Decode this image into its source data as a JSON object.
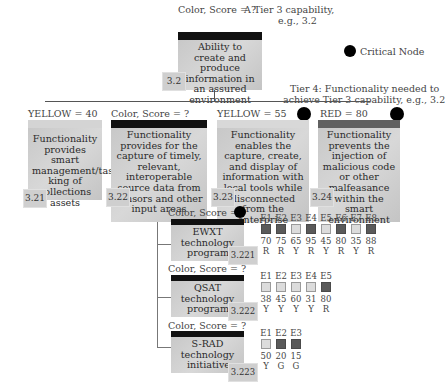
{
  "tier3": {
    "status": "Color, Score = ?",
    "annotation": "A Tier 3 capability, e.g., 3.2",
    "annotation_line1": "A Tier 3 capability,",
    "annotation_line2": "e.g., 3.2",
    "box_text": "Ability to create and produce information in an assured environment",
    "id": "3.2",
    "bar_color": "#111111"
  },
  "legend": {
    "critical_node_label": "Critical Node"
  },
  "tier4_annotation": {
    "line1": "Tier 4: Functionality needed to",
    "line2": "achieve Tier 3 capability, e.g., 3.2"
  },
  "tier4": [
    {
      "id": "3.21",
      "status": "YELLOW = 40",
      "bar_color": "#d4d4d4",
      "critical": false,
      "text": "Functionality provides smart management/tas king of collections assets"
    },
    {
      "id": "3.22",
      "status": "Color, Score = ?",
      "bar_color": "#111111",
      "critical": false,
      "text": "Functionality provides for the capture of timely, relevant, interoperable source data from sensors and other input areas"
    },
    {
      "id": "3.23",
      "status": "YELLOW = 55",
      "bar_color": "#d8d8d8",
      "critical": true,
      "text": "Functionality enables the capture, create, and display of information with local tools while disconnected from the enterprise"
    },
    {
      "id": "3.24",
      "status": "RED = 80",
      "bar_color": "#606060",
      "critical": true,
      "text": "Functionality prevents the injection of malicious code or other malfeasance within the smart environment"
    }
  ],
  "programs": [
    {
      "id": "3.221",
      "status": "Color, Score = ?",
      "critical": true,
      "name": "EWXT technology program",
      "line1": "EWXT",
      "line2": "technology",
      "line3": "program",
      "elements": [
        {
          "label": "E1",
          "score": "70",
          "rating": "R",
          "shade": "dark"
        },
        {
          "label": "E2",
          "score": "75",
          "rating": "R",
          "shade": "dark"
        },
        {
          "label": "E3",
          "score": "65",
          "rating": "Y",
          "shade": "light"
        },
        {
          "label": "E4",
          "score": "95",
          "rating": "R",
          "shade": "dark"
        },
        {
          "label": "E5",
          "score": "45",
          "rating": "Y",
          "shade": "light"
        },
        {
          "label": "E6",
          "score": "80",
          "rating": "R",
          "shade": "dark"
        },
        {
          "label": "E7",
          "score": "35",
          "rating": "Y",
          "shade": "light"
        },
        {
          "label": "E8",
          "score": "88",
          "rating": "R",
          "shade": "dark"
        }
      ]
    },
    {
      "id": "3.222",
      "status": "Color, Score = ?",
      "critical": false,
      "name": "QSAT technology program",
      "line1": "QSAT",
      "line2": "technology",
      "line3": "program",
      "elements": [
        {
          "label": "E1",
          "score": "38",
          "rating": "Y",
          "shade": "light"
        },
        {
          "label": "E2",
          "score": "45",
          "rating": "Y",
          "shade": "light"
        },
        {
          "label": "E3",
          "score": "60",
          "rating": "Y",
          "shade": "light"
        },
        {
          "label": "E4",
          "score": "31",
          "rating": "Y",
          "shade": "light"
        },
        {
          "label": "E5",
          "score": "80",
          "rating": "R",
          "shade": "dark"
        }
      ]
    },
    {
      "id": "3.223",
      "status": "Color, Score = ?",
      "critical": false,
      "name": "S-RAD technology initiative",
      "line1": "S-RAD",
      "line2": "technology",
      "line3": "initiative",
      "elements": [
        {
          "label": "E1",
          "score": "50",
          "rating": "Y",
          "shade": "light"
        },
        {
          "label": "E2",
          "score": "20",
          "rating": "G",
          "shade": "dark"
        },
        {
          "label": "E3",
          "score": "15",
          "rating": "G",
          "shade": "dark"
        }
      ]
    }
  ]
}
